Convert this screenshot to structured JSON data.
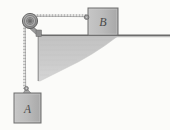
{
  "figure": {
    "type": "physics-free-body-diagram",
    "background_color": "#fbfbf9",
    "canvas": {
      "width": 170,
      "height": 130
    }
  },
  "labels": {
    "block_a": "A",
    "block_b": "B"
  },
  "colors": {
    "block_fill": "#b9b9b9",
    "block_stroke": "#6e6e6e",
    "table_surface": "#6b6b6b",
    "wall_shading": "#c9c9c9",
    "cord": "#9a9a9a",
    "cord_outline": "#7a7a7a",
    "pulley_outer": "#9d9d9d",
    "pulley_inner": "#b5b5b5",
    "pulley_stroke": "#5f5f5f",
    "bracket": "#8f8f8f",
    "label_text": "#4a4a4a"
  },
  "elements": {
    "block_a": {
      "name": "hanging-block-a",
      "x": 14,
      "y": 93,
      "width": 27,
      "height": 30,
      "hook_top": 88
    },
    "block_b": {
      "name": "resting-block-b",
      "x": 88,
      "y": 8,
      "width": 30,
      "height": 27
    },
    "pulley": {
      "name": "pulley-wheel",
      "cx": 30,
      "cy": 21,
      "r_outer": 7.5,
      "r_mid": 5.0,
      "r_hub": 2.4,
      "r_axle": 1.0
    },
    "cord_horizontal": {
      "name": "cord-horizontal-segment",
      "x1": 30,
      "y1": 15,
      "x2": 88,
      "y2": 18
    },
    "cord_vertical": {
      "name": "cord-vertical-segment",
      "x1": 24,
      "y1": 24,
      "x2": 27,
      "y2": 89
    },
    "table_top": {
      "name": "table-surface-line",
      "x1": 38,
      "y1": 35,
      "x2": 170,
      "y2": 35
    },
    "table_edge": {
      "name": "table-vertical-edge",
      "x1": 38,
      "y1": 35,
      "x2": 38,
      "y2": 81
    },
    "bracket": {
      "name": "pulley-mount-bracket",
      "from_x": 31,
      "from_y": 25,
      "to_x": 40,
      "to_y": 34
    },
    "shading": {
      "name": "table-body-shading",
      "apex_x": 115,
      "base_y": 81
    }
  }
}
